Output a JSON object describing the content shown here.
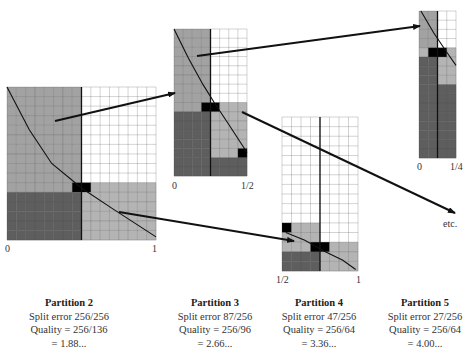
{
  "colors": {
    "white": "#ffffff",
    "mid": "#a2a2a2",
    "light": "#b4b4b4",
    "dark": "#5e5e5e",
    "black": "#000000",
    "grid": "#444444"
  },
  "partitions": [
    {
      "id": "p2",
      "title": "Partition 2",
      "split_error": "Split error 256/256",
      "quality": "Quality = 256/136",
      "value": "= 1.88...",
      "axis_left": "0",
      "axis_right": "1",
      "grid": {
        "x": 7,
        "y": 87,
        "w": 149,
        "h": 153,
        "cols": 16,
        "rows": 16,
        "split_col": 8
      }
    },
    {
      "id": "p3",
      "title": "Partition 3",
      "split_error": "Split error 87/256",
      "quality": "Quality = 256/96",
      "value": "= 2.66...",
      "axis_left": "0",
      "axis_right": "1/2",
      "grid": {
        "x": 174,
        "y": 29,
        "w": 73,
        "h": 147,
        "cols": 8,
        "rows": 16,
        "split_col": 4
      }
    },
    {
      "id": "p4",
      "title": "Partition 4",
      "split_error": "Split error 47/256",
      "quality": "Quality = 256/64",
      "value": "= 3.36...",
      "axis_left": "1/2",
      "axis_right": "1",
      "grid": {
        "x": 282,
        "y": 117,
        "w": 76,
        "h": 154,
        "cols": 8,
        "rows": 16,
        "split_col": 4
      }
    },
    {
      "id": "p5",
      "title": "Partition 5",
      "split_error": "Split error 27/256",
      "quality": "Quality = 256/64",
      "value": "= 4.00...",
      "axis_left": "0",
      "axis_right": "1/4",
      "grid": {
        "x": 419,
        "y": 11,
        "w": 37,
        "h": 147,
        "cols": 4,
        "rows": 16,
        "split_col": 2
      }
    }
  ],
  "arrows": [
    {
      "from": [
        55,
        121
      ],
      "to": [
        175,
        93
      ]
    },
    {
      "from": [
        119,
        212
      ],
      "to": [
        294,
        241
      ]
    },
    {
      "from": [
        197,
        56
      ],
      "to": [
        420,
        26
      ]
    },
    {
      "from": [
        242,
        112
      ],
      "to": [
        455,
        213
      ]
    }
  ],
  "etc_label": "etc."
}
